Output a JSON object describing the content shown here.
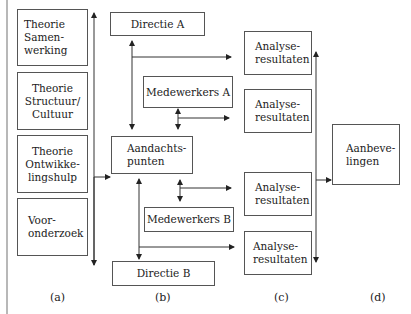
{
  "diagram": {
    "column_labels": [
      "(a)",
      "(b)",
      "(c)",
      "(d)"
    ],
    "column_a": {
      "boxes": [
        {
          "label": "Theorie Samen-werking",
          "lines": [
            "Theorie",
            "Samen-",
            "werking"
          ]
        },
        {
          "label": "Theorie Structuur/Cultuur",
          "lines": [
            "Theorie",
            "Structuur/",
            "Cultuur"
          ]
        },
        {
          "label": "Theorie Ontwikke-lingshulp",
          "lines": [
            "Theorie",
            "Ontwikke-",
            "lingshulp"
          ]
        },
        {
          "label": "Voor-onderzoek",
          "lines": [
            "Voor-",
            "onderzoek"
          ]
        }
      ]
    },
    "column_b": {
      "directie_a": "Directie A",
      "medewerkers_a": "Medewerkers A",
      "aandachtspunten": {
        "lines": [
          "Aandachts-",
          "punten"
        ]
      },
      "medewerkers_b": "Medewerkers B",
      "directie_b": "Directie B"
    },
    "column_c": {
      "boxes": [
        {
          "lines": [
            "Analyse-",
            "resultaten"
          ]
        },
        {
          "lines": [
            "Analyse-",
            "resultaten"
          ]
        },
        {
          "lines": [
            "Analyse-",
            "resultaten"
          ]
        },
        {
          "lines": [
            "Analyse-",
            "resultaten"
          ]
        }
      ]
    },
    "column_d": {
      "aanbevelingen": {
        "lines": [
          "Aanbeve-",
          "lingen"
        ]
      }
    },
    "connections": [
      {
        "from": "column_a",
        "to": "aandachtspunten"
      },
      {
        "from": "directie_a",
        "to": "aandachtspunten",
        "bidirectional": true
      },
      {
        "from": "directie_a-line",
        "to": "analyseresultaten_1"
      },
      {
        "from": "medewerkers_a",
        "to": "aandachtspunten",
        "bidirectional": true
      },
      {
        "from": "medewerkers_a-line",
        "to": "analyseresultaten_2"
      },
      {
        "from": "aandachtspunten",
        "to": "medewerkers_b",
        "bidirectional": true
      },
      {
        "from": "medewerkers_b-line",
        "to": "analyseresultaten_3"
      },
      {
        "from": "aandachtspunten",
        "to": "directie_b",
        "bidirectional": true
      },
      {
        "from": "directie_b-line",
        "to": "analyseresultaten_4"
      },
      {
        "from": "column_c",
        "to": "aanbevelingen"
      }
    ]
  }
}
